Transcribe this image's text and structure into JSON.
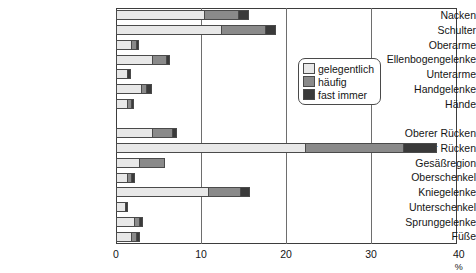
{
  "chart_data": {
    "type": "bar",
    "orientation": "horizontal",
    "stacked": true,
    "title": "",
    "xlabel": "%",
    "ylabel": "",
    "xlim": [
      0,
      40
    ],
    "xticks": [
      0,
      10,
      20,
      30,
      40
    ],
    "xtick_labels": [
      "0",
      "10",
      "20",
      "30",
      "40 %"
    ],
    "grid": true,
    "legend_position": "upper right",
    "legend": [
      "gelegentlich",
      "häufig",
      "fast immer"
    ],
    "series": [
      {
        "name": "gelegentlich",
        "color": "#e8e8e8",
        "values": [
          10.4,
          12.3,
          1.8,
          4.2,
          1.3,
          2.9,
          1.3,
          null,
          4.2,
          22.2,
          2.7,
          1.3,
          10.8,
          1.1,
          2.1,
          1.8
        ]
      },
      {
        "name": "häufig",
        "color": "#8a8a8a",
        "values": [
          3.9,
          5.2,
          0.6,
          1.7,
          0.0,
          0.6,
          0.5,
          null,
          2.4,
          11.6,
          3.1,
          0.5,
          3.8,
          0.0,
          0.6,
          0.6
        ]
      },
      {
        "name": "fast immer",
        "color": "#3a3a3a",
        "values": [
          1.3,
          1.3,
          0.3,
          0.5,
          0.5,
          0.7,
          0.3,
          null,
          0.6,
          4.0,
          0.0,
          0.4,
          1.2,
          0.3,
          0.5,
          0.4
        ]
      }
    ],
    "categories": [
      "Nacken",
      "Schulter",
      "Oberarme",
      "Ellenbogengelenke",
      "Unterarme",
      "Handgelenke",
      "Hände",
      "",
      "Oberer Rücken",
      "Unterer Rücken",
      "Gesäßregion",
      "Oberschenkel",
      "Kniegelenke",
      "Unterschenkel",
      "Sprunggelenke",
      "Füße"
    ],
    "totals": [
      15.6,
      18.8,
      2.7,
      6.4,
      1.8,
      4.2,
      2.1,
      null,
      7.2,
      37.8,
      5.8,
      2.2,
      15.8,
      1.4,
      3.2,
      2.8
    ]
  },
  "colors": {
    "gelegentlich": "#e8e8e8",
    "haeufig": "#8a8a8a",
    "fast_immer": "#3a3a3a",
    "axis": "#3d3d3d",
    "grid": "#6e6e6e",
    "text": "#151515"
  }
}
